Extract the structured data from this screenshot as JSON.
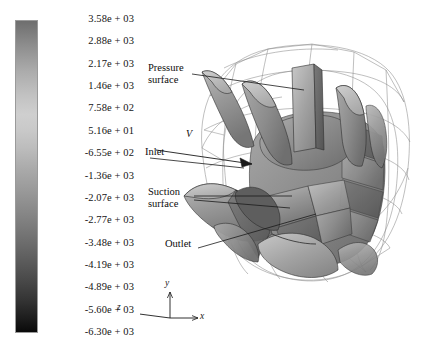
{
  "figure": {
    "type": "cfd-contour-plot",
    "background_color": "#ffffff"
  },
  "colorbar": {
    "name": "pressure-colorbar",
    "orientation": "vertical",
    "colormap": "grayscale",
    "top_color": "#6e6e6e",
    "mid_color": "#cfcfcf",
    "bottom_color": "#090909",
    "max": 3580,
    "min": -6300,
    "step": -705,
    "labels": [
      "3.58e + 03",
      "2.88e + 03",
      "2.17e + 03",
      "1.46e + 03",
      "7.58e + 02",
      "5.16e + 01",
      "-6.55e + 02",
      "-1.36e + 03",
      "-2.07e + 03",
      "-2.77e + 03",
      "-3.48e + 03",
      "-4.19e + 03",
      "-4.89e + 03",
      "-5.60e + 03",
      "-6.30e + 03"
    ],
    "values": [
      3580,
      2880,
      2170,
      1460,
      758,
      51.6,
      -655,
      -1360,
      -2070,
      -2770,
      -3480,
      -4190,
      -4890,
      -5600,
      -6300
    ]
  },
  "annotations": [
    {
      "name": "pressure-surface",
      "line1": "Pressure",
      "line2": "surface"
    },
    {
      "name": "inlet",
      "line1": "Inlet",
      "line2": ""
    },
    {
      "name": "suction-surface",
      "line1": "Suction",
      "line2": "surface"
    },
    {
      "name": "outlet",
      "line1": "Outlet",
      "line2": ""
    }
  ],
  "velocity_marker": {
    "name": "velocity-vector",
    "label": "V"
  },
  "axes_triad": {
    "name": "coordinate-axes",
    "x_label": "x",
    "y_label": "y",
    "z_label": "z"
  },
  "chart_data": {
    "type": "heatmap",
    "title": "",
    "xlabel": "",
    "ylabel": "",
    "colorbar_label": "",
    "colormap": "grayscale",
    "legend_position": "left",
    "grid": false,
    "clim": [
      -6300,
      3580
    ],
    "tick_values": [
      3580,
      2880,
      2170,
      1460,
      758,
      51.6,
      -655,
      -1360,
      -2070,
      -2770,
      -3480,
      -4190,
      -4890,
      -5600,
      -6300
    ],
    "tick_labels": [
      "3.58e + 03",
      "2.88e + 03",
      "2.17e + 03",
      "1.46e + 03",
      "7.58e + 02",
      "5.16e + 01",
      "-6.55e + 02",
      "-1.36e + 03",
      "-2.07e + 03",
      "-2.77e + 03",
      "-3.48e + 03",
      "-4.19e + 03",
      "-4.19e + 03",
      "-5.60e + 03",
      "-6.30e + 03"
    ],
    "annotations": [
      "Pressure surface",
      "Inlet",
      "Suction surface",
      "Outlet",
      "V"
    ]
  }
}
